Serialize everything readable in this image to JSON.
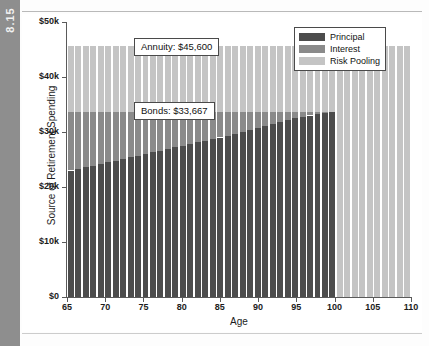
{
  "figure": {
    "tab_label": "8.15"
  },
  "chart_data": {
    "type": "bar",
    "title": "",
    "xlabel": "Age",
    "ylabel": "Source of Retirement Spending",
    "stacked": true,
    "grid": false,
    "legend_position": "top-right",
    "xlim": [
      65,
      110
    ],
    "ylim": [
      0,
      50000
    ],
    "xticks": [
      65,
      70,
      75,
      80,
      85,
      90,
      95,
      100,
      105,
      110
    ],
    "xticklabels": [
      "65",
      "70",
      "75",
      "80",
      "85",
      "90",
      "95",
      "100",
      "105",
      "110"
    ],
    "yticks": [
      0,
      10000,
      20000,
      30000,
      40000,
      50000
    ],
    "yticklabels": [
      "$0",
      "$10k",
      "$20k",
      "$30k",
      "$40k",
      "$50k"
    ],
    "categories": [
      65,
      66,
      67,
      68,
      69,
      70,
      71,
      72,
      73,
      74,
      75,
      76,
      77,
      78,
      79,
      80,
      81,
      82,
      83,
      84,
      85,
      86,
      87,
      88,
      89,
      90,
      91,
      92,
      93,
      94,
      95,
      96,
      97,
      98,
      99,
      100,
      101,
      102,
      103,
      104,
      105,
      106,
      107,
      108,
      109,
      110
    ],
    "series": [
      {
        "name": "Principal",
        "color": "#4c4c4c",
        "values": [
          23000,
          23300,
          23600,
          23900,
          24200,
          24500,
          24800,
          25100,
          25400,
          25700,
          26000,
          26300,
          26600,
          26900,
          27200,
          27500,
          27800,
          28100,
          28400,
          28700,
          29000,
          29350,
          29700,
          30050,
          30400,
          30750,
          31100,
          31450,
          31800,
          32150,
          32500,
          32750,
          33000,
          33200,
          33430,
          33667,
          0,
          0,
          0,
          0,
          0,
          0,
          0,
          0,
          0,
          0
        ]
      },
      {
        "name": "Interest",
        "color": "#8a8a8a",
        "values": [
          10667,
          10367,
          10067,
          9767,
          9467,
          9167,
          8867,
          8567,
          8267,
          7967,
          7667,
          7367,
          7067,
          6767,
          6467,
          6167,
          5867,
          5567,
          5267,
          4967,
          4667,
          4317,
          3967,
          3617,
          3267,
          2917,
          2567,
          2217,
          1867,
          1517,
          1167,
          917,
          667,
          467,
          237,
          0,
          0,
          0,
          0,
          0,
          0,
          0,
          0,
          0,
          0,
          0
        ]
      },
      {
        "name": "Risk Pooling",
        "color": "#c4c4c4",
        "values": [
          11933,
          11933,
          11933,
          11933,
          11933,
          11933,
          11933,
          11933,
          11933,
          11933,
          11933,
          11933,
          11933,
          11933,
          11933,
          11933,
          11933,
          11933,
          11933,
          11933,
          11933,
          11933,
          11933,
          11933,
          11933,
          11933,
          11933,
          11933,
          11933,
          11933,
          11933,
          11933,
          11933,
          11933,
          11933,
          11933,
          45600,
          45600,
          45600,
          45600,
          45600,
          45600,
          45600,
          45600,
          45600,
          45600
        ]
      }
    ],
    "annotations": [
      {
        "name": "annuity",
        "text": "Annuity: $45,600",
        "value": 45600
      },
      {
        "name": "bonds",
        "text": "Bonds: $33,667",
        "value": 33667
      }
    ],
    "legend": [
      {
        "label": "Principal",
        "color": "#4c4c4c"
      },
      {
        "label": "Interest",
        "color": "#8a8a8a"
      },
      {
        "label": "Risk Pooling",
        "color": "#c4c4c4"
      }
    ]
  }
}
